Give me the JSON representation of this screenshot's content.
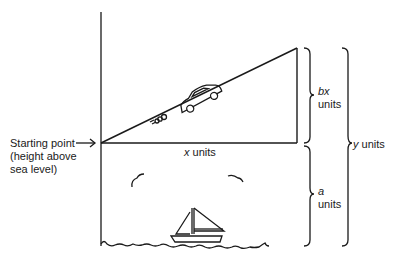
{
  "labels": {
    "starting_point": [
      "Starting point",
      "(height above",
      "sea level)"
    ],
    "x_units": {
      "var": "x",
      "unit": "units"
    },
    "bx_units": {
      "var": "bx",
      "unit": "units"
    },
    "a_units": {
      "var": "a",
      "unit": "units"
    },
    "y_units": {
      "var": "y",
      "unit": "units"
    }
  },
  "colors": {
    "line": "#1a1a1a",
    "background": "#ffffff"
  }
}
